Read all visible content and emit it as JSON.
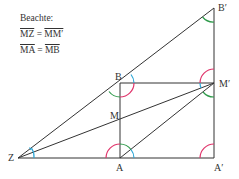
{
  "note": {
    "title": "Beachte:",
    "equations": [
      {
        "left": "MZ",
        "op": "=",
        "right": "MM′"
      },
      {
        "left": "MA",
        "op": "=",
        "right": "MB"
      }
    ]
  },
  "points": {
    "Z": {
      "label": "Z",
      "x": 18,
      "y": 158
    },
    "A": {
      "label": "A",
      "x": 120,
      "y": 158
    },
    "A_prime": {
      "label": "A′",
      "x": 214,
      "y": 158
    },
    "B": {
      "label": "B",
      "x": 120,
      "y": 83
    },
    "M": {
      "label": "M",
      "x": 120,
      "y": 120
    },
    "M_prime": {
      "label": "M′",
      "x": 214,
      "y": 83
    },
    "B_prime": {
      "label": "B′",
      "x": 214,
      "y": 8
    }
  },
  "colors": {
    "line": "#333333",
    "red": "#e0336a",
    "green": "#2e9a4a",
    "blue": "#2aa6d6"
  }
}
